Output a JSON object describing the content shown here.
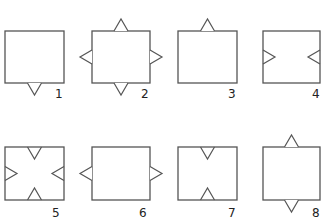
{
  "diagram": {
    "stroke_color": "#555555",
    "background": "#ffffff",
    "figures": [
      {
        "label": "1",
        "square": {
          "x": 5,
          "y": 31,
          "w": 59,
          "h": 52
        },
        "label_pos": {
          "x": 55,
          "y": 88
        },
        "triangles": [
          {
            "edge": "bottom",
            "dir": "out",
            "pos": 0.5
          }
        ]
      },
      {
        "label": "2",
        "square": {
          "x": 92,
          "y": 31,
          "w": 58,
          "h": 52
        },
        "label_pos": {
          "x": 141,
          "y": 88
        },
        "triangles": [
          {
            "edge": "top",
            "dir": "out",
            "pos": 0.5
          },
          {
            "edge": "left",
            "dir": "out",
            "pos": 0.5
          },
          {
            "edge": "right",
            "dir": "out",
            "pos": 0.5
          },
          {
            "edge": "bottom",
            "dir": "out",
            "pos": 0.5
          }
        ]
      },
      {
        "label": "3",
        "square": {
          "x": 178,
          "y": 31,
          "w": 59,
          "h": 52
        },
        "label_pos": {
          "x": 228,
          "y": 88
        },
        "triangles": [
          {
            "edge": "top",
            "dir": "out",
            "pos": 0.5
          }
        ]
      },
      {
        "label": "4",
        "square": {
          "x": 263,
          "y": 31,
          "w": 57,
          "h": 52
        },
        "label_pos": {
          "x": 312,
          "y": 88
        },
        "triangles": [
          {
            "edge": "left",
            "dir": "in",
            "pos": 0.5
          },
          {
            "edge": "right",
            "dir": "in",
            "pos": 0.5
          }
        ]
      },
      {
        "label": "5",
        "square": {
          "x": 5,
          "y": 147,
          "w": 59,
          "h": 53
        },
        "label_pos": {
          "x": 52,
          "y": 207
        },
        "triangles": [
          {
            "edge": "top",
            "dir": "in",
            "pos": 0.5
          },
          {
            "edge": "left",
            "dir": "in",
            "pos": 0.5
          },
          {
            "edge": "right",
            "dir": "in",
            "pos": 0.5
          },
          {
            "edge": "bottom",
            "dir": "in",
            "pos": 0.5
          }
        ]
      },
      {
        "label": "6",
        "square": {
          "x": 92,
          "y": 147,
          "w": 58,
          "h": 53
        },
        "label_pos": {
          "x": 139,
          "y": 207
        },
        "triangles": [
          {
            "edge": "left",
            "dir": "out",
            "pos": 0.5
          },
          {
            "edge": "right",
            "dir": "out",
            "pos": 0.5
          }
        ]
      },
      {
        "label": "7",
        "square": {
          "x": 178,
          "y": 147,
          "w": 59,
          "h": 53
        },
        "label_pos": {
          "x": 228,
          "y": 207
        },
        "triangles": [
          {
            "edge": "top",
            "dir": "in",
            "pos": 0.5
          },
          {
            "edge": "bottom",
            "dir": "in",
            "pos": 0.5
          }
        ]
      },
      {
        "label": "8",
        "square": {
          "x": 263,
          "y": 147,
          "w": 57,
          "h": 53
        },
        "label_pos": {
          "x": 312,
          "y": 207
        },
        "triangles": [
          {
            "edge": "top",
            "dir": "out",
            "pos": 0.5
          },
          {
            "edge": "bottom",
            "dir": "out",
            "pos": 0.5
          }
        ]
      }
    ]
  }
}
